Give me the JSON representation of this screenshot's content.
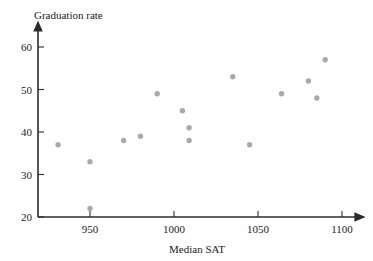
{
  "chart_data": {
    "type": "scatter",
    "title": "",
    "xlabel": "Median SAT",
    "ylabel": "Graduation rate",
    "xlim": [
      920,
      1110
    ],
    "ylim": [
      20,
      63
    ],
    "xticks": [
      950,
      1000,
      1050,
      1100
    ],
    "yticks": [
      20,
      30,
      40,
      50,
      60
    ],
    "xtick_labels": [
      "950",
      "1000",
      "1050",
      "1100"
    ],
    "ytick_labels": [
      "20",
      "30",
      "40",
      "50",
      "60"
    ],
    "grid": false,
    "legend": null,
    "marker": "filled-circle",
    "marker_color": "#a9a9a9",
    "axis_color": "#2b2b2b",
    "points": [
      {
        "x": 931,
        "y": 37
      },
      {
        "x": 950,
        "y": 33
      },
      {
        "x": 950,
        "y": 22
      },
      {
        "x": 970,
        "y": 38
      },
      {
        "x": 980,
        "y": 39
      },
      {
        "x": 990,
        "y": 49
      },
      {
        "x": 1005,
        "y": 45
      },
      {
        "x": 1009,
        "y": 41
      },
      {
        "x": 1009,
        "y": 38
      },
      {
        "x": 1035,
        "y": 53
      },
      {
        "x": 1045,
        "y": 37
      },
      {
        "x": 1064,
        "y": 49
      },
      {
        "x": 1080,
        "y": 52
      },
      {
        "x": 1085,
        "y": 48
      },
      {
        "x": 1090,
        "y": 57
      }
    ]
  },
  "labels": {
    "y_axis_title": "Graduation rate",
    "x_axis_title": "Median SAT"
  }
}
